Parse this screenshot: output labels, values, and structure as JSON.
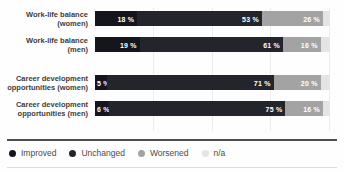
{
  "chart_data": {
    "type": "bar",
    "orientation": "horizontal-stacked",
    "title": "",
    "xlabel": "",
    "ylabel": "",
    "xlim": [
      0,
      100
    ],
    "gridlines_percent": [
      25,
      50,
      75,
      100
    ],
    "value_suffix": " %",
    "categories": [
      {
        "line1": "Work-life balance",
        "line2": "(women)"
      },
      {
        "line1": "Work-life balance",
        "line2": "(men)"
      },
      {
        "line1": "Career development",
        "line2": "opportunities (women)"
      },
      {
        "line1": "Career development",
        "line2": "opportunities (men)"
      }
    ],
    "series": [
      {
        "name": "Improved",
        "color": "#15151d",
        "values": [
          18,
          19,
          5,
          6
        ],
        "labeled": true
      },
      {
        "name": "Unchanged",
        "color": "#24242d",
        "values": [
          53,
          61,
          71,
          75
        ],
        "labeled": true
      },
      {
        "name": "Worsened",
        "color": "#a3a3a3",
        "values": [
          26,
          16,
          20,
          16
        ],
        "labeled": true
      },
      {
        "name": "n/a",
        "color": "#e4e4e4",
        "values": [
          3,
          4,
          4,
          3
        ],
        "labeled": false
      }
    ],
    "legend": {
      "position": "bottom",
      "items": [
        "Improved",
        "Unchanged",
        "Worsened",
        "n/a"
      ]
    }
  }
}
